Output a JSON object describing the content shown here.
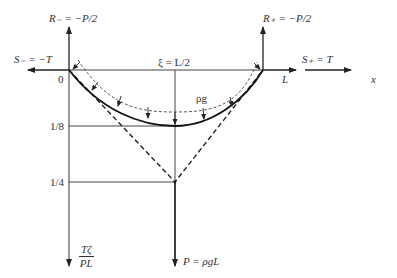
{
  "diagram": {
    "labels": {
      "r_minus": "R₋ = −P/2",
      "r_plus": "R₊ = −P/2",
      "s_minus": "S₋ = −T",
      "s_plus": "S₊ = T",
      "origin": "0",
      "end": "L",
      "x_axis": "x",
      "midpoint": "ξ = L/2",
      "load": "ρg",
      "tick_1_8": "1/8",
      "tick_1_4": "1/4",
      "y_axis_num": "Tζ",
      "y_axis_den": "PL",
      "p_force": "P = ρgL"
    },
    "colors": {
      "line": "#333333",
      "curve": "#111111",
      "background": "#ffffff"
    }
  }
}
